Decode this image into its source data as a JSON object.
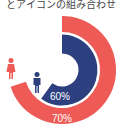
{
  "title": "とアイコンの組み合わせ",
  "colors": {
    "female": "#ee5a55",
    "male": "#2c3f7e",
    "background": "#ffffff"
  },
  "chart_data": {
    "type": "radial-progress",
    "title": "とアイコンの組み合わせ",
    "series": [
      {
        "name": "female",
        "icon": "female-icon",
        "value": 70,
        "label": "70%",
        "color": "#ee5a55",
        "ring": "outer"
      },
      {
        "name": "male",
        "icon": "male-icon",
        "value": 60,
        "label": "60%",
        "color": "#2c3f7e",
        "ring": "inner"
      }
    ],
    "max": 100
  }
}
